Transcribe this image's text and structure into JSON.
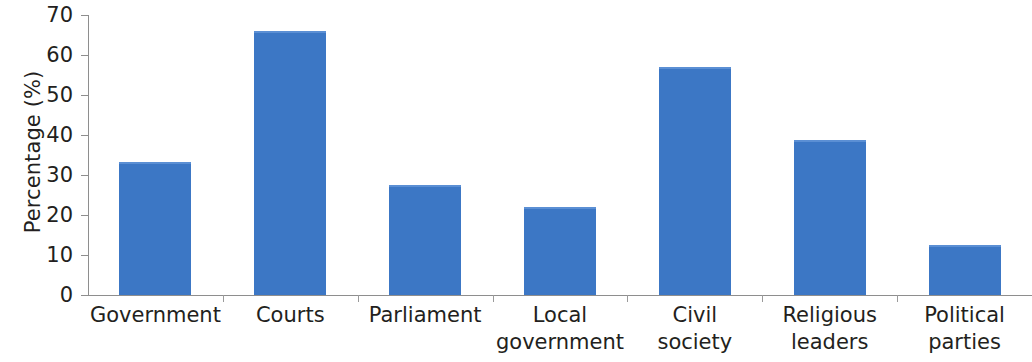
{
  "chart_data": {
    "type": "bar",
    "title": "",
    "xlabel": "",
    "ylabel": "Percentage (%)",
    "ylim": [
      0,
      70
    ],
    "ytick_step": 10,
    "yticks": [
      0,
      10,
      20,
      30,
      40,
      50,
      60,
      70
    ],
    "ytick_labels": [
      "0",
      "10",
      "20",
      "30",
      "40",
      "50",
      "60",
      "70"
    ],
    "grid": false,
    "legend": false,
    "bar_color": "#3c77c5",
    "bar_top_edge_color": "#5b8fd4",
    "axis_color": "#8e8e8e",
    "text_color": "#231f20",
    "categories": [
      "Government",
      "Courts",
      "Parliament",
      "Local government",
      "Civil society",
      "Religious leaders",
      "Political parties"
    ],
    "category_lines": [
      [
        "Government",
        ""
      ],
      [
        "Courts",
        ""
      ],
      [
        "Parliament",
        ""
      ],
      [
        "Local",
        "government"
      ],
      [
        "Civil",
        "society"
      ],
      [
        "Religious",
        "leaders"
      ],
      [
        "Political",
        "parties"
      ]
    ],
    "values": [
      33.3,
      66.0,
      27.5,
      22.0,
      57.0,
      38.8,
      12.5
    ]
  }
}
